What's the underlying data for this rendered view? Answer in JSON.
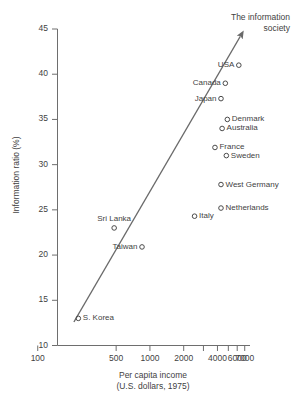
{
  "chart_data": {
    "type": "scatter",
    "title": "",
    "xlabel": "Per capita income",
    "xlabel_sub": "(U.S. dollars, 1975)",
    "ylabel": "Information ratio (%)",
    "xscale": "log",
    "xlim": [
      150,
      7800
    ],
    "ylim": [
      10,
      45
    ],
    "grid": false,
    "legend": false,
    "xticks": [
      100,
      500,
      1000,
      2000,
      3000,
      4000,
      5000,
      6000,
      7000
    ],
    "xtick_labels": [
      "100",
      "500",
      "1000",
      "2000",
      "",
      "4000",
      "",
      "6000",
      "7000"
    ],
    "yticks": [
      10,
      15,
      20,
      25,
      30,
      35,
      40,
      45
    ],
    "ytick_labels": [
      "10",
      "15",
      "20",
      "25",
      "30",
      "35",
      "40",
      "45"
    ],
    "annotations": [
      {
        "text_line1": "The information",
        "text_line2": "society",
        "kind": "trend-arrow-label"
      }
    ],
    "trendline": {
      "type": "arrow",
      "x_start": 210,
      "y_start": 12.6,
      "x_end": 6400,
      "y_end": 44.2
    },
    "points": [
      {
        "label": "USA",
        "x": 6200,
        "y": 41.0,
        "label_side": "left"
      },
      {
        "label": "Canada",
        "x": 4700,
        "y": 39.0,
        "label_side": "left"
      },
      {
        "label": "Japan",
        "x": 4300,
        "y": 37.3,
        "label_side": "left"
      },
      {
        "label": "Denmark",
        "x": 4900,
        "y": 35.0,
        "label_side": "right"
      },
      {
        "label": "Australia",
        "x": 4400,
        "y": 34.0,
        "label_side": "right"
      },
      {
        "label": "France",
        "x": 3800,
        "y": 31.9,
        "label_side": "right"
      },
      {
        "label": "Sweden",
        "x": 4800,
        "y": 31.0,
        "label_side": "right"
      },
      {
        "label": "West Germany",
        "x": 4300,
        "y": 27.8,
        "label_side": "right"
      },
      {
        "label": "Netherlands",
        "x": 4300,
        "y": 25.2,
        "label_side": "right"
      },
      {
        "label": "Italy",
        "x": 2500,
        "y": 24.3,
        "label_side": "right"
      },
      {
        "label": "Sri Lanka",
        "x": 480,
        "y": 23.0,
        "label_side": "above"
      },
      {
        "label": "Taiwan",
        "x": 850,
        "y": 20.9,
        "label_side": "left"
      },
      {
        "label": "S. Korea",
        "x": 230,
        "y": 13.0,
        "label_side": "right"
      }
    ],
    "colors": {
      "marker_stroke": "#4a4a4a",
      "axis": "#6e6e6e",
      "trend": "#6a6a6a",
      "text": "#3f3f3f",
      "background": "#ffffff"
    }
  }
}
